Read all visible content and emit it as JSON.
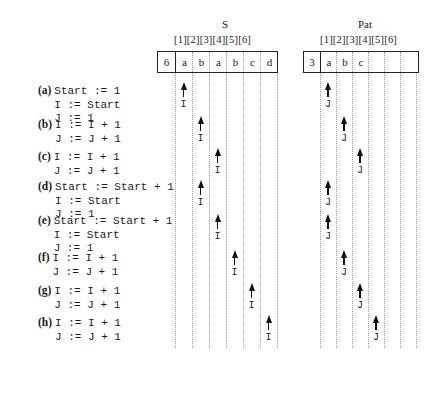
{
  "strings": {
    "S": {
      "title": "S",
      "indices": "[1][2][3][4][5][6]",
      "length": "6",
      "chars": [
        "a",
        "b",
        "a",
        "b",
        "c",
        "d"
      ]
    },
    "Pat": {
      "title": "Pat",
      "indices": "[1][2][3][4][5][6]",
      "length": "3",
      "chars": [
        "a",
        "b",
        "c",
        "",
        "",
        ""
      ]
    }
  },
  "steps": [
    {
      "tag": "(a)",
      "lines": [
        "Start := 1",
        "I := Start",
        "J := 1"
      ],
      "I": 1,
      "J": 1,
      "I_label": "I",
      "J_label": "J"
    },
    {
      "tag": "(b)",
      "lines": [
        "I := I + 1",
        "J := J + 1"
      ],
      "I": 2,
      "J": 2,
      "I_label": "I",
      "J_label": "J"
    },
    {
      "tag": "(c)",
      "lines": [
        "I := I + 1",
        "J := J + 1"
      ],
      "I": 3,
      "J": 3,
      "I_label": "I",
      "J_label": "J"
    },
    {
      "tag": "(d)",
      "lines": [
        "Start := Start + 1",
        "I := Start",
        "J := 1"
      ],
      "I": 2,
      "J": 1,
      "I_label": "I",
      "J_label": "J"
    },
    {
      "tag": "(e)",
      "lines": [
        "Start := Start + 1",
        "I := Start",
        "J := 1"
      ],
      "I": 3,
      "J": 1,
      "I_label": "I",
      "J_label": "J"
    },
    {
      "tag": "(f)",
      "lines": [
        "I := I + 1",
        "J := J + 1"
      ],
      "I": 4,
      "J": 2,
      "I_label": "I",
      "J_label": "J"
    },
    {
      "tag": "(g)",
      "lines": [
        "I := I + 1",
        "J := J + 1"
      ],
      "I": 5,
      "J": 3,
      "I_label": "I",
      "J_label": "J"
    },
    {
      "tag": "(h)",
      "lines": [
        "I := I + 1",
        "J := J + 1"
      ],
      "I": 6,
      "J": 4,
      "I_label": "I",
      "J_label": "J"
    }
  ]
}
